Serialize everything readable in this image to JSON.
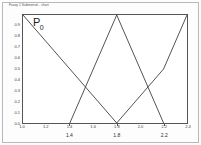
{
  "figure": {
    "caption": "Fuzzy 1 Submenuit - chart",
    "series_label_base": "P",
    "series_label_sub": "0"
  },
  "chart_data": {
    "type": "line",
    "title": "Fuzzy 1 Submenuit - chart",
    "xlabel": "",
    "ylabel": "",
    "grid": false,
    "legend": "none",
    "annotations": [
      "P0"
    ],
    "xlim": [
      1.0,
      2.4
    ],
    "ylim": [
      0.0,
      1.0
    ],
    "x_major_ticks": [
      1.4,
      1.8,
      2.2
    ],
    "x_major_tick_labels": [
      "1.4",
      "1.8",
      "2.2"
    ],
    "x_minor_ticks": [
      1.0,
      1.2,
      1.4,
      1.6,
      1.8,
      2.0,
      2.2,
      2.4
    ],
    "x_minor_tick_labels": [
      "1.0",
      "1.2",
      "1.4",
      "1.6",
      "1.8",
      "2.0",
      "2.2",
      "2.4"
    ],
    "y_ticks": [
      0.0,
      0.1,
      0.2,
      0.3,
      0.4,
      0.5,
      0.6,
      0.7,
      0.8,
      0.9
    ],
    "y_tick_labels": [
      "0.0",
      "0.1",
      "0.2",
      "0.3",
      "0.4",
      "0.5",
      "0.6",
      "0.7",
      "0.8",
      "0.9"
    ],
    "series": [
      {
        "name": "membership-1",
        "color": "#3f3f3f",
        "x": [
          1.0,
          1.4,
          1.8
        ],
        "y": [
          1.0,
          0.5,
          0.0
        ]
      },
      {
        "name": "membership-2",
        "color": "#3f3f3f",
        "x": [
          1.4,
          1.8,
          2.2
        ],
        "y": [
          0.0,
          1.0,
          0.0
        ]
      },
      {
        "name": "membership-3",
        "color": "#3f3f3f",
        "x": [
          1.8,
          2.2,
          2.4
        ],
        "y": [
          0.0,
          0.5,
          1.0
        ]
      }
    ]
  }
}
